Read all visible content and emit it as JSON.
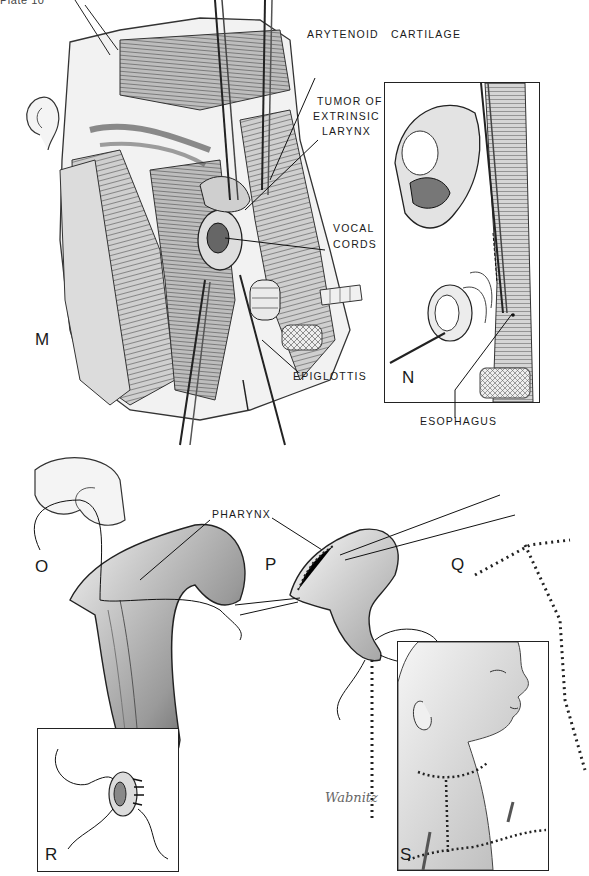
{
  "plate": {
    "title": "Plate 10"
  },
  "panels": {
    "M": {
      "letter": "M",
      "labels": {
        "arytenoid": "ARYTENOID",
        "cartilage": "CARTILAGE",
        "tumor_line1": "TUMOR OF",
        "tumor_line2": "EXTRINSIC",
        "tumor_line3": "LARYNX",
        "vocal_line1": "VOCAL",
        "vocal_line2": "CORDS",
        "epiglottis": "EPIGLOTTIS"
      }
    },
    "N": {
      "letter": "N",
      "labels": {
        "esophagus": "ESOPHAGUS"
      }
    },
    "O": {
      "letter": "O",
      "labels": {
        "pharynx": "PHARYNX"
      }
    },
    "P": {
      "letter": "P"
    },
    "Q": {
      "letter": "Q"
    },
    "R": {
      "letter": "R"
    },
    "S": {
      "letter": "S"
    }
  },
  "signature": "Wabnitz",
  "colors": {
    "ink": "#1a1a1a",
    "shade_dark": "#555555",
    "shade_mid": "#9a9a9a",
    "shade_light": "#d6d6d6",
    "paper": "#ffffff"
  }
}
